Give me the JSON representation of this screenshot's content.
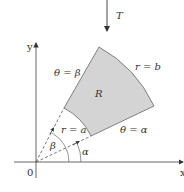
{
  "diagram": {
    "title_arrow_label": "T",
    "axes": {
      "x_label": "x",
      "y_label": "y",
      "origin_label": "0"
    },
    "region_label": "R",
    "boundaries": {
      "outer_arc": "r = b",
      "inner_arc": "r = a",
      "lower_ray": "θ = α",
      "upper_ray": "θ = β"
    },
    "angle_labels": {
      "alpha": "α",
      "beta": "β"
    },
    "colors": {
      "region_fill": "#d4d4d4",
      "stroke": "#555555",
      "text": "#333333"
    }
  }
}
